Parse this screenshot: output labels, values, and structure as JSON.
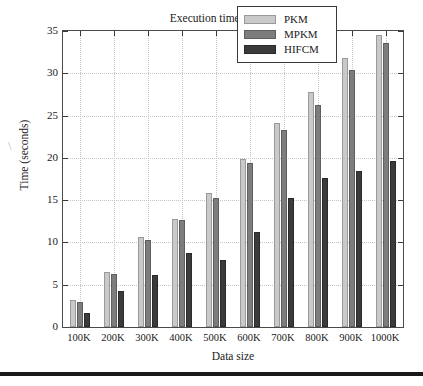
{
  "chart_data": {
    "type": "bar",
    "title": "Execution time comparison",
    "xlabel": "Data size",
    "ylabel": "Time (seconds)",
    "categories": [
      "100K",
      "200K",
      "300K",
      "400K",
      "500K",
      "600K",
      "700K",
      "800K",
      "900K",
      "1000K"
    ],
    "series": [
      {
        "name": "PKM",
        "color": "#c9c9c9",
        "values": [
          3.2,
          6.5,
          10.7,
          12.8,
          15.8,
          19.9,
          24.1,
          27.8,
          31.8,
          34.5
        ]
      },
      {
        "name": "MPKM",
        "color": "#7d7d7d",
        "values": [
          3.0,
          6.3,
          10.3,
          12.6,
          15.2,
          19.4,
          23.3,
          26.3,
          30.4,
          33.6
        ]
      },
      {
        "name": "HIFCM",
        "color": "#3b3b3b",
        "values": [
          1.7,
          4.2,
          6.1,
          8.7,
          7.9,
          11.2,
          15.2,
          17.6,
          18.5,
          19.6
        ]
      }
    ],
    "ylim": [
      0,
      35
    ],
    "yticks": [
      0,
      5,
      10,
      15,
      20,
      25,
      30,
      35
    ],
    "ytick_labels": [
      "0",
      "5",
      "10",
      "15",
      "20",
      "25",
      "30",
      "35"
    ],
    "grid": true,
    "legend_position": "upper right"
  },
  "legend": {
    "entries": [
      {
        "label": "PKM"
      },
      {
        "label": "MPKM"
      },
      {
        "label": "HIFCM"
      }
    ]
  },
  "page": {
    "smudge_mark": "\\"
  }
}
